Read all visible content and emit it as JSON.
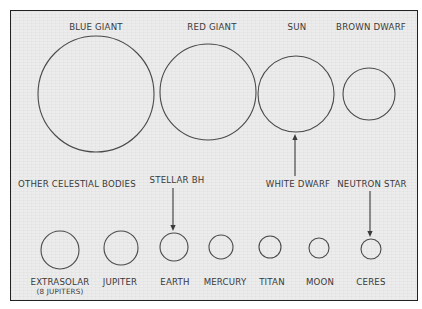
{
  "diagram": {
    "title": "",
    "top_row": {
      "bodies": [
        {
          "id": "blue-giant",
          "label": "BLUE GIANT",
          "cx": 96,
          "cy": 94,
          "r": 58,
          "lx": 96,
          "ly": 30
        },
        {
          "id": "red-giant",
          "label": "RED GIANT",
          "cx": 208,
          "cy": 92,
          "r": 48,
          "lx": 212,
          "ly": 30
        },
        {
          "id": "sun",
          "label": "SUN",
          "cx": 296,
          "cy": 94,
          "r": 38,
          "lx": 297,
          "ly": 30
        },
        {
          "id": "brown-dwarf",
          "label": "BROWN DWARF",
          "cx": 369,
          "cy": 94,
          "r": 26,
          "lx": 371,
          "ly": 30
        }
      ]
    },
    "section_label": "OTHER CELESTIAL BODIES",
    "bottom_row": {
      "bodies": [
        {
          "id": "extrasolar",
          "label": "EXTRASOLAR",
          "sublabel": "(8 JUPITERS)",
          "cx": 60,
          "cy": 250,
          "r": 19,
          "lx": 60,
          "ly": 285
        },
        {
          "id": "jupiter",
          "label": "JUPITER",
          "cx": 121,
          "cy": 248,
          "r": 17,
          "lx": 120,
          "ly": 285
        },
        {
          "id": "earth",
          "label": "EARTH",
          "cx": 174,
          "cy": 247,
          "r": 14,
          "lx": 175,
          "ly": 285
        },
        {
          "id": "mercury",
          "label": "MERCURY",
          "cx": 221,
          "cy": 247,
          "r": 12,
          "lx": 225,
          "ly": 285
        },
        {
          "id": "titan",
          "label": "TITAN",
          "cx": 270,
          "cy": 247,
          "r": 11,
          "lx": 272,
          "ly": 285
        },
        {
          "id": "moon",
          "label": "MOON",
          "cx": 319,
          "cy": 248,
          "r": 10,
          "lx": 320,
          "ly": 285
        },
        {
          "id": "ceres",
          "label": "CERES",
          "cx": 371,
          "cy": 249,
          "r": 10,
          "lx": 371,
          "ly": 285
        }
      ]
    },
    "annotations": [
      {
        "id": "white-dwarf",
        "label": "WHITE DWARF",
        "lx": 298,
        "ly": 187,
        "points_to": "sun",
        "x": 295,
        "y1": 176,
        "y2": 134,
        "direction": "up"
      },
      {
        "id": "stellar-bh",
        "label": "STELLAR BH",
        "lx": 177,
        "ly": 183,
        "points_to": "earth",
        "x": 173,
        "y1": 188,
        "y2": 231,
        "direction": "down"
      },
      {
        "id": "neutron-star",
        "label": "NEUTRON STAR",
        "lx": 372,
        "ly": 187,
        "points_to": "ceres",
        "x": 370,
        "y1": 191,
        "y2": 237,
        "direction": "down"
      }
    ],
    "colors": {
      "paper": "#ececec",
      "ink": "#3a3a3a",
      "border": "#222222"
    }
  }
}
